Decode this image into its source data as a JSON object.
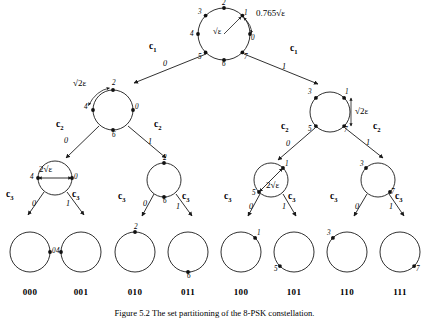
{
  "figure": {
    "caption": "Figure 5.2  The set partitioning of the 8-PSK constellation.",
    "root": {
      "points": [
        "0",
        "1",
        "2",
        "3",
        "4",
        "5",
        "6",
        "7"
      ],
      "inner_distance_label": "√ε",
      "outer_distance_label": "0.765√ε"
    },
    "level1": {
      "coset_left": "c",
      "coset_left_sub": "1",
      "coset_right": "c",
      "coset_right_sub": "1",
      "branch_left": "0",
      "branch_right": "1"
    },
    "level2": {
      "coset_labels": [
        "c",
        "c",
        "c",
        "c"
      ],
      "coset_subs": [
        "2",
        "2",
        "2",
        "2"
      ],
      "branches": [
        "0",
        "1",
        "0",
        "1"
      ],
      "left_circle_points": [
        "0",
        "2",
        "4",
        "6"
      ],
      "left_distance_label": "√2ε",
      "right_circle_points": [
        "1",
        "3",
        "5",
        "7"
      ],
      "right_distance_label": "√2ε"
    },
    "level3": {
      "coset_labels": [
        "c",
        "c",
        "c",
        "c",
        "c",
        "c",
        "c",
        "c"
      ],
      "coset_subs": [
        "3",
        "3",
        "3",
        "3",
        "3",
        "3",
        "3",
        "3"
      ],
      "branches": [
        "0",
        "1",
        "0",
        "1",
        "0",
        "1",
        "0",
        "1"
      ],
      "circles": [
        {
          "points": [
            "4",
            "0"
          ],
          "distance_label": "2√ε"
        },
        {
          "points": [
            "2",
            "6"
          ],
          "distance_label": ""
        },
        {
          "points": [
            "1",
            "5"
          ],
          "distance_label": "2√ε"
        },
        {
          "points": [
            "3",
            "7"
          ],
          "distance_label": ""
        }
      ]
    },
    "leaves": [
      {
        "label": "000",
        "point": "0"
      },
      {
        "label": "001",
        "point": "4"
      },
      {
        "label": "010",
        "point": "2"
      },
      {
        "label": "011",
        "point": "6"
      },
      {
        "label": "100",
        "point": "1"
      },
      {
        "label": "101",
        "point": "5"
      },
      {
        "label": "110",
        "point": "3"
      },
      {
        "label": "111",
        "point": "7"
      }
    ],
    "colors": {
      "stroke": "#1a1a1a",
      "text": "#000000",
      "background": "#ffffff"
    }
  }
}
